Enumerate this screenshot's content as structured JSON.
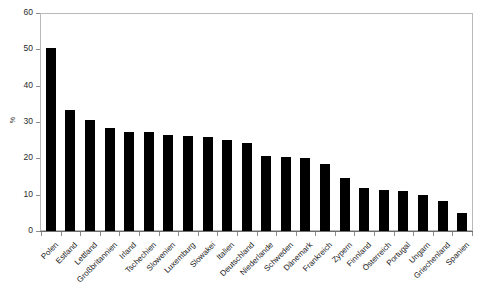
{
  "chart_data": {
    "type": "bar",
    "title": "",
    "subtitle": "",
    "xlabel": "",
    "ylabel": "%",
    "ylim": [
      0,
      60
    ],
    "ytick_labels": [
      "60",
      "50",
      "40",
      "30",
      "20",
      "10",
      "0"
    ],
    "ytick_values": [
      60,
      50,
      40,
      30,
      20,
      10,
      0
    ],
    "grid": false,
    "legend": false,
    "bar_color": "#000000",
    "frame_color": "#b9b9b9",
    "categories": [
      "Polen",
      "Estland",
      "Lettland",
      "Großbritannien",
      "Irland",
      "Tschechien",
      "Slowenien",
      "Luxemburg",
      "Slowakei",
      "Italien",
      "Deutschland",
      "Niederlande",
      "Schweden",
      "Dänemark",
      "Frankreich",
      "Zypern",
      "Finnland",
      "Österreich",
      "Portugal",
      "Ungarn",
      "Griechenland",
      "Spanien"
    ],
    "values": [
      50.5,
      33.2,
      30.5,
      28.3,
      27.3,
      27.2,
      26.5,
      26.2,
      26.0,
      25.0,
      24.2,
      20.6,
      20.4,
      20.1,
      18.4,
      14.6,
      11.8,
      11.2,
      10.9,
      10.0,
      8.3,
      5.0
    ]
  }
}
